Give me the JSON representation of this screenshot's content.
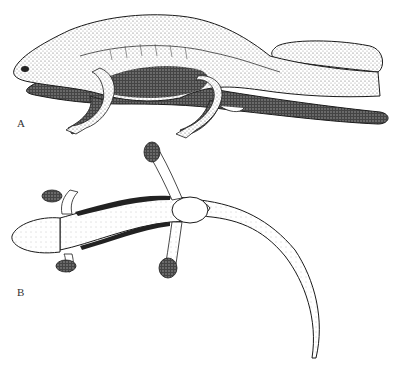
{
  "figure": {
    "panels": [
      {
        "label": "A",
        "subject": "salamander-pair-lateral-view"
      },
      {
        "label": "B",
        "subject": "salamander-dorsal-view"
      }
    ],
    "colors": {
      "ink": "#1a1a1a",
      "stipple": "#555555",
      "background": "#ffffff"
    }
  }
}
